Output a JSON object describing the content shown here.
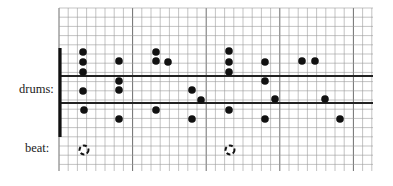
{
  "labels": {
    "drums": "drums:",
    "beat": "beat:"
  },
  "grid": {
    "x0": 59,
    "y0": 8,
    "x1": 373,
    "y1": 171,
    "cell": 9.2,
    "major_every": 8,
    "color": "#9a9a9a",
    "major_color": "#6e6e6e"
  },
  "staff_lines": [
    {
      "y": 76
    },
    {
      "y": 103
    }
  ],
  "bar": {
    "x": 60,
    "y_top": 48,
    "y_bottom": 137
  },
  "dots": [
    {
      "x": 83,
      "y": 52
    },
    {
      "x": 83,
      "y": 62
    },
    {
      "x": 83,
      "y": 72
    },
    {
      "x": 83,
      "y": 91
    },
    {
      "x": 84,
      "y": 110
    },
    {
      "x": 119,
      "y": 61
    },
    {
      "x": 119,
      "y": 81
    },
    {
      "x": 119,
      "y": 90
    },
    {
      "x": 119,
      "y": 119
    },
    {
      "x": 156,
      "y": 52
    },
    {
      "x": 156,
      "y": 61
    },
    {
      "x": 168,
      "y": 62
    },
    {
      "x": 156,
      "y": 110
    },
    {
      "x": 192,
      "y": 90
    },
    {
      "x": 201,
      "y": 100
    },
    {
      "x": 192,
      "y": 119
    },
    {
      "x": 229,
      "y": 51
    },
    {
      "x": 229,
      "y": 62
    },
    {
      "x": 229,
      "y": 72
    },
    {
      "x": 229,
      "y": 110
    },
    {
      "x": 265,
      "y": 62
    },
    {
      "x": 265,
      "y": 81
    },
    {
      "x": 275,
      "y": 99
    },
    {
      "x": 265,
      "y": 119
    },
    {
      "x": 302,
      "y": 61
    },
    {
      "x": 315,
      "y": 61
    },
    {
      "x": 325,
      "y": 99
    },
    {
      "x": 340,
      "y": 119
    }
  ],
  "beats": [
    {
      "x": 84,
      "y": 150
    },
    {
      "x": 230,
      "y": 150
    }
  ],
  "colors": {
    "ink": "#111111",
    "line": "#222222"
  }
}
